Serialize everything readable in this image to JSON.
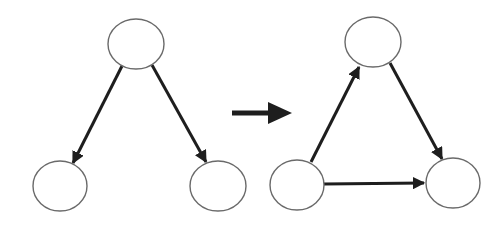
{
  "diagram": {
    "title": "",
    "colors": {
      "background": "#ffffff",
      "node_stroke": "#6a6a6a",
      "edge": "#1e1e1e"
    },
    "graphs": [
      {
        "name": "before",
        "nodes": [
          {
            "id": "A",
            "label": "",
            "cx": 136,
            "cy": 44,
            "rx": 28,
            "ry": 25
          },
          {
            "id": "B",
            "label": "",
            "cx": 60,
            "cy": 186,
            "rx": 27,
            "ry": 25
          },
          {
            "id": "C",
            "label": "",
            "cx": 218,
            "cy": 186,
            "rx": 28,
            "ry": 25
          }
        ],
        "edges": [
          {
            "from": "A",
            "to": "B",
            "directed": true
          },
          {
            "from": "A",
            "to": "C",
            "directed": true
          }
        ]
      },
      {
        "name": "after",
        "nodes": [
          {
            "id": "A",
            "label": "",
            "cx": 373,
            "cy": 42,
            "rx": 28,
            "ry": 25
          },
          {
            "id": "B",
            "label": "",
            "cx": 297,
            "cy": 185,
            "rx": 27,
            "ry": 25
          },
          {
            "id": "C",
            "label": "",
            "cx": 453,
            "cy": 183,
            "rx": 27,
            "ry": 25
          }
        ],
        "edges": [
          {
            "from": "B",
            "to": "A",
            "directed": true
          },
          {
            "from": "A",
            "to": "C",
            "directed": true
          },
          {
            "from": "B",
            "to": "C",
            "directed": true
          }
        ]
      }
    ],
    "transformation_arrow": {
      "icon": "right-arrow-icon",
      "label": ""
    }
  }
}
